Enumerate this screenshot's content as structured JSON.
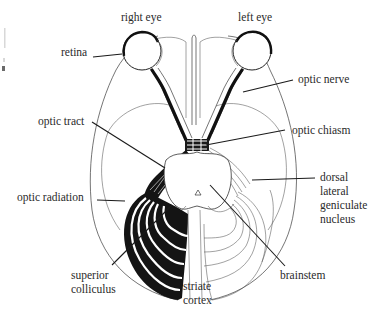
{
  "figure": {
    "type": "anatomical-diagram",
    "colors": {
      "ink": "#141414",
      "line": "#3a3a3a",
      "background": "#ffffff",
      "label": "#2a2a2a"
    }
  },
  "labels": {
    "right_eye": "right eye",
    "left_eye": "left eye",
    "retina": "retina",
    "optic_nerve": "optic nerve",
    "optic_tract": "optic tract",
    "optic_chiasm": "optic chiasm",
    "dorsal_lgn": {
      "line1": "dorsal",
      "line2": "lateral",
      "line3": "geniculate",
      "line4": "nucleus"
    },
    "optic_radiation": "optic radiation",
    "superior_colliculus": {
      "line1": "superior",
      "line2": "colliculus"
    },
    "striate_cortex": {
      "line1": "striate",
      "line2": "cortex"
    },
    "brainstem": "brainstem"
  }
}
